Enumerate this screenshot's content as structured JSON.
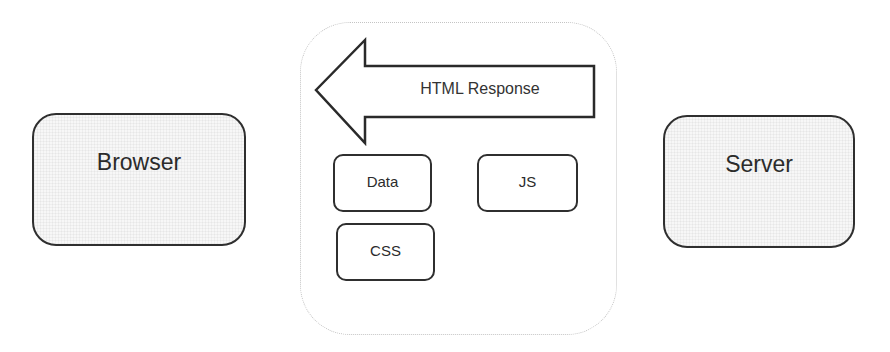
{
  "diagram": {
    "nodes": {
      "browser": {
        "label": "Browser"
      },
      "server": {
        "label": "Server"
      },
      "data": {
        "label": "Data"
      },
      "js": {
        "label": "JS"
      },
      "css": {
        "label": "CSS"
      }
    },
    "arrow": {
      "label": "HTML Response",
      "direction": "server-to-browser"
    },
    "container": {
      "style": "dotted rounded",
      "contains": [
        "HTML Response",
        "Data",
        "JS",
        "CSS"
      ]
    },
    "colors": {
      "stroke": "#2f2f2f",
      "fill": "#f7f7f7",
      "dotted_border": "#c4c4c4"
    }
  }
}
